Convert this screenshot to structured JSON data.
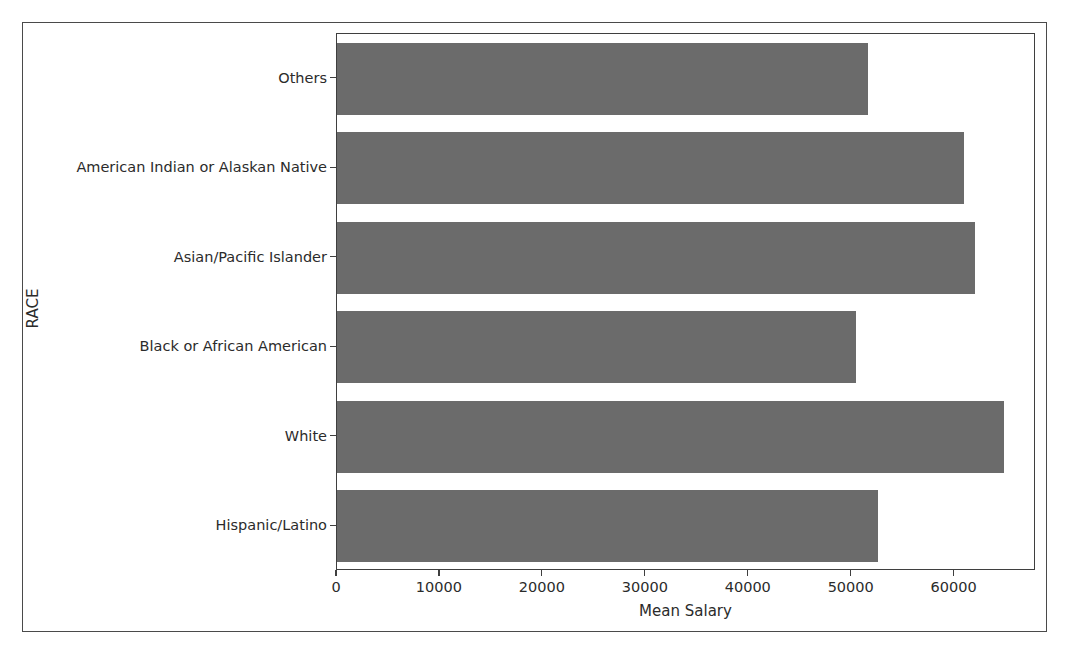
{
  "chart_data": {
    "type": "bar",
    "orientation": "horizontal",
    "title": "",
    "xlabel": "Mean Salary",
    "ylabel": "RACE",
    "categories": [
      "Hispanic/Latino",
      "White",
      "Black or African American",
      "Asian/Pacific Islander",
      "American Indian or Alaskan Native",
      "Others"
    ],
    "values": [
      52600,
      64800,
      50400,
      62000,
      60900,
      51600
    ],
    "xlim": [
      0,
      67900
    ],
    "ylim_note": "categorical axis, 6 categories plotted bottom-to-top",
    "xticks": [
      0,
      10000,
      20000,
      30000,
      40000,
      50000,
      60000
    ],
    "xtick_labels": [
      "0",
      "10000",
      "20000",
      "30000",
      "40000",
      "50000",
      "60000"
    ],
    "grid": false,
    "legend": false,
    "bar_color": "#6b6b6b",
    "axis_color": "#3f3f3f",
    "text_color": "#2b2b2b"
  }
}
